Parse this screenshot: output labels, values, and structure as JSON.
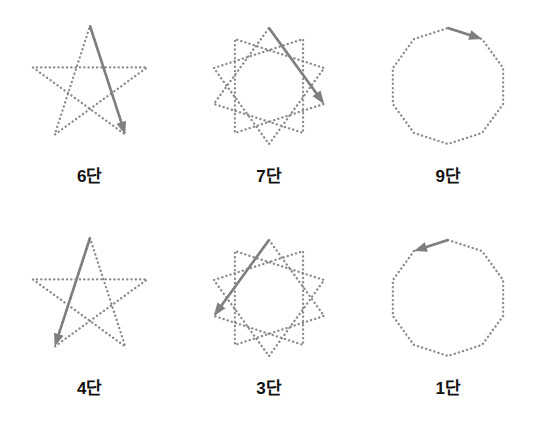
{
  "figure": {
    "background_color": "#ffffff",
    "dot_color": "#8a8a8a",
    "arrow_color": "#7f7f7f",
    "label_color": "#111111",
    "rows": 2,
    "columns": 3
  },
  "panels": [
    {
      "label": "6단",
      "shape_name": "pentagram",
      "vertices": 5,
      "step": 2,
      "schlafli": "{5/2}",
      "arrow_direction": "down-left",
      "arrow_from_index": 0,
      "arrow_to_index": 2,
      "arrow_start": [
        75,
        18
      ],
      "arrow_end": [
        39,
        137
      ]
    },
    {
      "label": "7단",
      "shape_name": "ten-pointed-star",
      "vertices": 10,
      "step": 3,
      "schlafli": "{10/3}",
      "arrow_direction": "down-left",
      "arrow_from_index": 0,
      "arrow_to_index": 3,
      "arrow_start": [
        89,
        19
      ],
      "arrow_end": [
        17,
        110
      ]
    },
    {
      "label": "9단",
      "shape_name": "decagon",
      "vertices": 10,
      "step": 1,
      "schlafli": "{10/1}",
      "arrow_direction": "left",
      "arrow_from_index": 0,
      "arrow_to_index": 1,
      "arrow_start": [
        77,
        19
      ],
      "arrow_end": [
        35,
        31
      ]
    },
    {
      "label": "4단",
      "shape_name": "pentagram",
      "vertices": 5,
      "step": 2,
      "schlafli": "{5/2}",
      "arrow_direction": "down-right",
      "arrow_from_index": 0,
      "arrow_to_index": 3,
      "arrow_start": [
        75,
        18
      ],
      "arrow_end": [
        114,
        137
      ]
    },
    {
      "label": "3단",
      "shape_name": "ten-pointed-star",
      "vertices": 10,
      "step": 3,
      "schlafli": "{10/3}",
      "arrow_direction": "down-right",
      "arrow_from_index": 0,
      "arrow_to_index": 7,
      "arrow_start": [
        61,
        19
      ],
      "arrow_end": [
        133,
        110
      ]
    },
    {
      "label": "1단",
      "shape_name": "decagon",
      "vertices": 10,
      "step": 1,
      "schlafli": "{10/1}",
      "arrow_direction": "right",
      "arrow_from_index": 0,
      "arrow_to_index": 9,
      "arrow_start": [
        73,
        19
      ],
      "arrow_end": [
        115,
        31
      ]
    }
  ]
}
